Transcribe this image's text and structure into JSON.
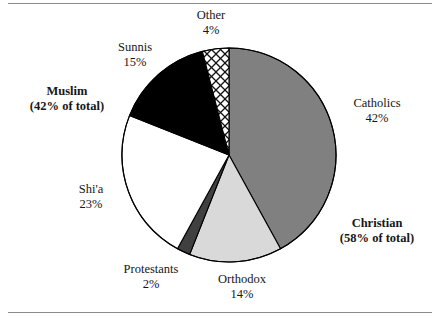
{
  "figure": {
    "title": "",
    "has_top_rule": true,
    "has_bottom_rule": true
  },
  "colors": {
    "catholics": "#808080",
    "orthodox": "#d9d9d9",
    "protestants": "#404040",
    "shia": "#ffffff",
    "sunnis": "#000000",
    "other": "crosshatch",
    "outline": "#000000",
    "rule": "#8a8a8a",
    "text": "#161616"
  },
  "labels": {
    "other": {
      "name": "Other",
      "pct": "4%"
    },
    "sunnis": {
      "name": "Sunnis",
      "pct": "15%"
    },
    "shia": {
      "name": "Shi'a",
      "pct": "23%"
    },
    "protestants": {
      "name": "Protestants",
      "pct": "2%"
    },
    "orthodox": {
      "name": "Orthodox",
      "pct": "14%"
    },
    "catholics": {
      "name": "Catholics",
      "pct": "42%"
    },
    "muslim_group": {
      "name": "Muslim",
      "pct": "(42% of total)"
    },
    "christian_group": {
      "name": "Christian",
      "pct": "(58% of total)"
    }
  },
  "chart_data": {
    "type": "pie",
    "title": "",
    "xlabel": "",
    "ylabel": "",
    "legend_position": "none",
    "grid": false,
    "start_angle_deg": 0,
    "direction": "clockwise",
    "center": {
      "x": 229,
      "y": 155
    },
    "radius": 107,
    "categories": [
      "Catholics",
      "Orthodox",
      "Protestants",
      "Shi'a",
      "Sunnis",
      "Other"
    ],
    "values": [
      42,
      14,
      2,
      23,
      15,
      4
    ],
    "value_labels": [
      "42%",
      "14%",
      "2%",
      "23%",
      "15%",
      "4%"
    ],
    "slices": [
      {
        "label": "Catholics",
        "value": 42,
        "value_label": "42%",
        "fill": "#808080",
        "pattern": "solid",
        "group": "Christian"
      },
      {
        "label": "Orthodox",
        "value": 14,
        "value_label": "14%",
        "fill": "#d9d9d9",
        "pattern": "solid",
        "group": "Christian"
      },
      {
        "label": "Protestants",
        "value": 2,
        "value_label": "2%",
        "fill": "#404040",
        "pattern": "solid",
        "group": "Christian"
      },
      {
        "label": "Shi'a",
        "value": 23,
        "value_label": "23%",
        "fill": "#ffffff",
        "pattern": "solid",
        "group": "Muslim"
      },
      {
        "label": "Sunnis",
        "value": 15,
        "value_label": "15%",
        "fill": "#000000",
        "pattern": "solid",
        "group": "Muslim"
      },
      {
        "label": "Other",
        "value": 4,
        "value_label": "4%",
        "fill": "#ffffff",
        "pattern": "crosshatch",
        "group": "Muslim"
      }
    ],
    "groups": [
      {
        "name": "Christian",
        "value": 58,
        "value_label": "(58% of total)",
        "members": [
          "Catholics",
          "Orthodox",
          "Protestants"
        ]
      },
      {
        "name": "Muslim",
        "value": 42,
        "value_label": "(42% of total)",
        "members": [
          "Shi'a",
          "Sunnis",
          "Other"
        ]
      }
    ],
    "total": 100
  }
}
